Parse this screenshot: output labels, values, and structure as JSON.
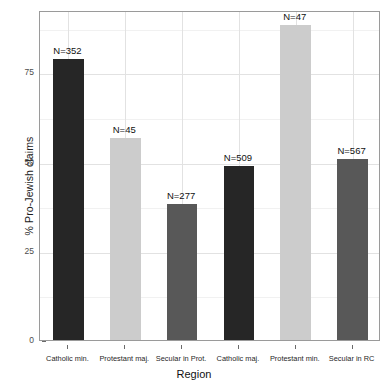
{
  "chart_data": {
    "type": "bar",
    "title": "",
    "xlabel": "Region",
    "ylabel": "% Pro-Jewish claims",
    "categories": [
      "Catholic min.",
      "Protestant maj.",
      "Secular in Prot.",
      "Catholic maj.",
      "Protestant min.",
      "Secular in RC"
    ],
    "values": [
      78.8,
      56.7,
      38.1,
      48.7,
      88.2,
      50.8
    ],
    "point_labels": [
      "N=352",
      "N=45",
      "N=277",
      "N=509",
      "N=47",
      "N=567"
    ],
    "bar_colors": [
      "#262626",
      "#cccccc",
      "#585858",
      "#262626",
      "#cccccc",
      "#585858"
    ],
    "ylim": [
      0,
      92.5
    ],
    "yticks": [
      0,
      25,
      50,
      75
    ],
    "ytick_labels": [
      "0",
      "25",
      "50",
      "75"
    ],
    "grid": true,
    "legend": "none"
  },
  "axes": {
    "y_title": "% Pro-Jewish claims",
    "x_title": "Region"
  }
}
